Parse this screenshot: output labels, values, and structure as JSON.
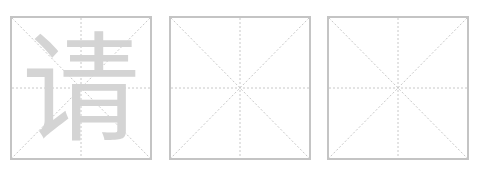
{
  "worksheet": {
    "boxes": [
      {
        "guide_char": "请",
        "guide_color": "#d4d4d4"
      },
      {
        "guide_char": ""
      },
      {
        "guide_char": ""
      }
    ],
    "border_color": "#c4c4c4",
    "guide_line_color": "#c8c8c8"
  }
}
